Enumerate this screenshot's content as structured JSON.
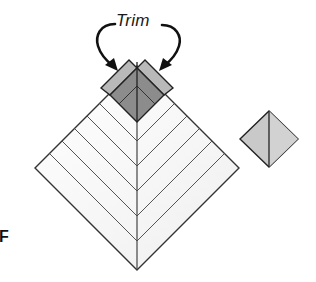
{
  "figure": {
    "label": "F",
    "annotation": {
      "text": "Trim",
      "arrows": [
        {
          "name": "left-trim-arrow",
          "direction": "curves-left-then-down-right"
        },
        {
          "name": "right-trim-arrow",
          "direction": "curves-right-then-down-left"
        }
      ]
    },
    "main_block": {
      "shape": "diamond",
      "center_x": 137,
      "top_y": 66,
      "mid_y": 168,
      "bottom_y": 270,
      "half_width": 102,
      "stripe_apex_ys": [
        141,
        166,
        191,
        216,
        241
      ],
      "fill": "#f7f7f7",
      "stroke": "#333333"
    },
    "center_square": {
      "shape": "diamond",
      "fill": "#8c8c8c",
      "stroke": "#222222"
    },
    "trim_rails": {
      "fill": "#b9b9b9",
      "stroke": "#222222"
    },
    "side_square": {
      "shape": "diamond",
      "center_x": 269,
      "top_y": 111,
      "mid_y": 139,
      "bottom_y": 167,
      "half_width": 29,
      "fill": "#c9c9c9",
      "stroke": "#222222"
    }
  }
}
